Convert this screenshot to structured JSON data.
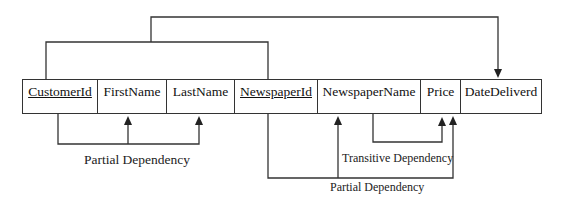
{
  "diagram": {
    "attributes": [
      {
        "name": "CustomerId",
        "primary_key": true,
        "x": 22,
        "w": 76
      },
      {
        "name": "FirstName",
        "primary_key": false,
        "x": 97,
        "w": 70
      },
      {
        "name": "LastName",
        "primary_key": false,
        "x": 166,
        "w": 69
      },
      {
        "name": "NewspaperId",
        "primary_key": true,
        "x": 234,
        "w": 84
      },
      {
        "name": "NewspaperName",
        "primary_key": false,
        "x": 317,
        "w": 104
      },
      {
        "name": "Price",
        "primary_key": false,
        "x": 420,
        "w": 41
      },
      {
        "name": "DateDeliverd",
        "primary_key": false,
        "x": 460,
        "w": 82
      }
    ],
    "labels": {
      "partial_dependency_1": "Partial Dependency",
      "transitive_dependency": "Transitive Dependency",
      "partial_dependency_2": "Partial Dependency"
    },
    "dependencies": [
      {
        "type": "full",
        "from": [
          "CustomerId",
          "NewspaperId"
        ],
        "to": [
          "DateDeliverd"
        ]
      },
      {
        "type": "partial",
        "from": [
          "CustomerId"
        ],
        "to": [
          "FirstName",
          "LastName"
        ]
      },
      {
        "type": "transitive",
        "from": [
          "NewspaperName"
        ],
        "to": [
          "Price"
        ]
      },
      {
        "type": "partial",
        "from": [
          "NewspaperId"
        ],
        "to": [
          "NewspaperName",
          "Price"
        ]
      }
    ],
    "line_color": "#333333"
  }
}
